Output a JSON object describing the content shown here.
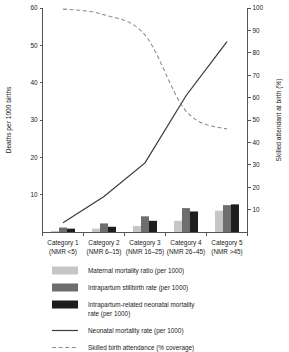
{
  "chart_data": {
    "type": "bar",
    "title": "",
    "categories": [
      "Category 1",
      "Category 2",
      "Category 3",
      "Category 4",
      "Category 5"
    ],
    "category_sublabels": [
      "(NMR <5)",
      "(NMR 6–15)",
      "(NMR 16–25)",
      "(NMR 26–45)",
      "(NMR >45)"
    ],
    "ylabel": "Deaths per 1000 births",
    "ylabel_right": "Skilled attendant at birth (%)",
    "xlabel": "",
    "ylim": [
      0,
      60
    ],
    "ylim_right": [
      0,
      100
    ],
    "yticks": [
      10,
      20,
      30,
      40,
      50,
      60
    ],
    "yticks_right": [
      10,
      20,
      30,
      40,
      50,
      60,
      70,
      80,
      90,
      100
    ],
    "grid": false,
    "legend_position": "below",
    "series": [
      {
        "name": "Maternal mortality ratio (per 1000)",
        "kind": "bar",
        "color": "#c6c6c6",
        "axis": "left",
        "values": [
          0.3,
          0.9,
          1.6,
          3.0,
          5.7
        ]
      },
      {
        "name": "Intrapartum stillbirth rate (per 1000)",
        "kind": "bar",
        "color": "#6e6e6e",
        "axis": "left",
        "values": [
          1.2,
          2.3,
          4.2,
          6.4,
          7.2
        ]
      },
      {
        "name": "Intrapartum-related neonatal mortality rate (per 1000)",
        "kind": "bar",
        "color": "#1e1e1e",
        "axis": "left",
        "values": [
          0.9,
          1.4,
          3.0,
          5.5,
          7.4
        ]
      },
      {
        "name": "Neonatal mortality rate (per 1000)",
        "kind": "line",
        "style": "solid",
        "color": "#3b3b3b",
        "axis": "left",
        "values": [
          2.5,
          9.5,
          18.5,
          36.5,
          51.0
        ]
      },
      {
        "name": "Skilled birth attendance (% coverage)",
        "kind": "line",
        "style": "dashed",
        "color": "#8a8a8a",
        "axis": "right",
        "values": [
          99.5,
          97.0,
          88.0,
          54.0,
          46.0
        ]
      }
    ]
  },
  "axes": {
    "left_title": "Deaths per 1000 births",
    "right_title": "Skilled attendant at birth (%)",
    "left_ticks": [
      "10",
      "20",
      "30",
      "40",
      "50",
      "60"
    ],
    "right_ticks": [
      "10",
      "20",
      "30",
      "40",
      "50",
      "60",
      "70",
      "80",
      "90",
      "100"
    ]
  },
  "xaxis": {
    "labels": [
      {
        "line1": "Category 1",
        "line2": "(NMR <5)"
      },
      {
        "line1": "Category 2",
        "line2": "(NMR 6–15)"
      },
      {
        "line1": "Category 3",
        "line2": "(NMR 16–25)"
      },
      {
        "line1": "Category 4",
        "line2": "(NMR 26–45)"
      },
      {
        "line1": "Category 5",
        "line2": "(NMR >45)"
      }
    ]
  },
  "legend": {
    "items": [
      {
        "label": "Maternal mortality ratio (per 1000)",
        "swatch": "#c6c6c6",
        "type": "swatch"
      },
      {
        "label": "Intrapartum stillbirth rate (per 1000)",
        "swatch": "#6e6e6e",
        "type": "swatch"
      },
      {
        "label": "Intrapartum-related neonatal mortality",
        "label2": "rate (per 1000)",
        "swatch": "#1e1e1e",
        "type": "swatch"
      },
      {
        "label": "Neonatal mortality rate (per 1000)",
        "swatch": "#3b3b3b",
        "type": "solid-line"
      },
      {
        "label": "Skilled birth attendance (% coverage)",
        "swatch": "#8a8a8a",
        "type": "dashed-line"
      }
    ]
  },
  "colors": {
    "maternal": "#c6c6c6",
    "stillbirth": "#6e6e6e",
    "neonatal_bar": "#1e1e1e",
    "nmr_line": "#3b3b3b",
    "sba_line": "#8a8a8a",
    "axis": "#555555",
    "background": "#ffffff"
  }
}
